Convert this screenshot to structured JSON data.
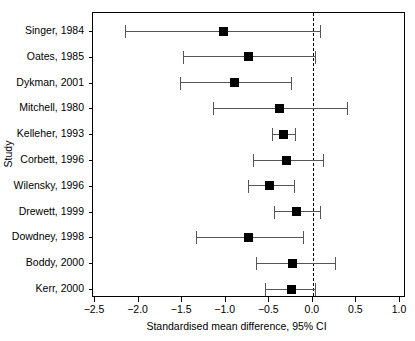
{
  "chart_data": {
    "type": "scatter",
    "subtype": "forest-plot",
    "title": "",
    "xlabel": "Standardised mean difference, 95% CI",
    "ylabel": "Study",
    "xlim": [
      -2.5,
      1.0
    ],
    "xticks": [
      -2.5,
      -2.0,
      -1.5,
      -1.0,
      -0.5,
      0.0,
      0.5,
      1.0
    ],
    "xticklabels": [
      "−2.5",
      "−2.0",
      "−1.5",
      "−1.0",
      "−0.5",
      "0.0",
      "0.5",
      "1.0"
    ],
    "grid": false,
    "legend": null,
    "reference_line": {
      "value": 0.0,
      "style": "dashed",
      "color": "#000000"
    },
    "marker_color": "#000000",
    "ci_color": "#555555",
    "categories": [
      "Singer, 1984",
      "Oates, 1985",
      "Dykman, 2001",
      "Mitchell, 1980",
      "Kelleher, 1993",
      "Corbett, 1996",
      "Wilensky, 1996",
      "Drewett, 1999",
      "Dowdney, 1998",
      "Boddy, 2000",
      "Kerr, 2000"
    ],
    "points": [
      {
        "study": "Singer, 1984",
        "estimate": -1.03,
        "ci_low": -2.16,
        "ci_high": 0.08
      },
      {
        "study": "Oates, 1985",
        "estimate": -0.74,
        "ci_low": -1.49,
        "ci_high": 0.02
      },
      {
        "study": "Dykman, 2001",
        "estimate": -0.9,
        "ci_low": -1.53,
        "ci_high": -0.25
      },
      {
        "study": "Mitchell, 1980",
        "estimate": -0.38,
        "ci_low": -1.15,
        "ci_high": 0.39
      },
      {
        "study": "Kelleher, 1993",
        "estimate": -0.34,
        "ci_low": -0.47,
        "ci_high": -0.2
      },
      {
        "study": "Corbett, 1996",
        "estimate": -0.3,
        "ci_low": -0.69,
        "ci_high": 0.12
      },
      {
        "study": "Wilensky, 1996",
        "estimate": -0.5,
        "ci_low": -0.75,
        "ci_high": -0.22
      },
      {
        "study": "Drewett, 1999",
        "estimate": -0.19,
        "ci_low": -0.45,
        "ci_high": 0.08
      },
      {
        "study": "Dowdney, 1998",
        "estimate": -0.74,
        "ci_low": -1.34,
        "ci_high": -0.11
      },
      {
        "study": "Boddy, 2000",
        "estimate": -0.23,
        "ci_low": -0.65,
        "ci_high": 0.25
      },
      {
        "study": "Kerr, 2000",
        "estimate": -0.25,
        "ci_low": -0.55,
        "ci_high": 0.03
      }
    ]
  }
}
